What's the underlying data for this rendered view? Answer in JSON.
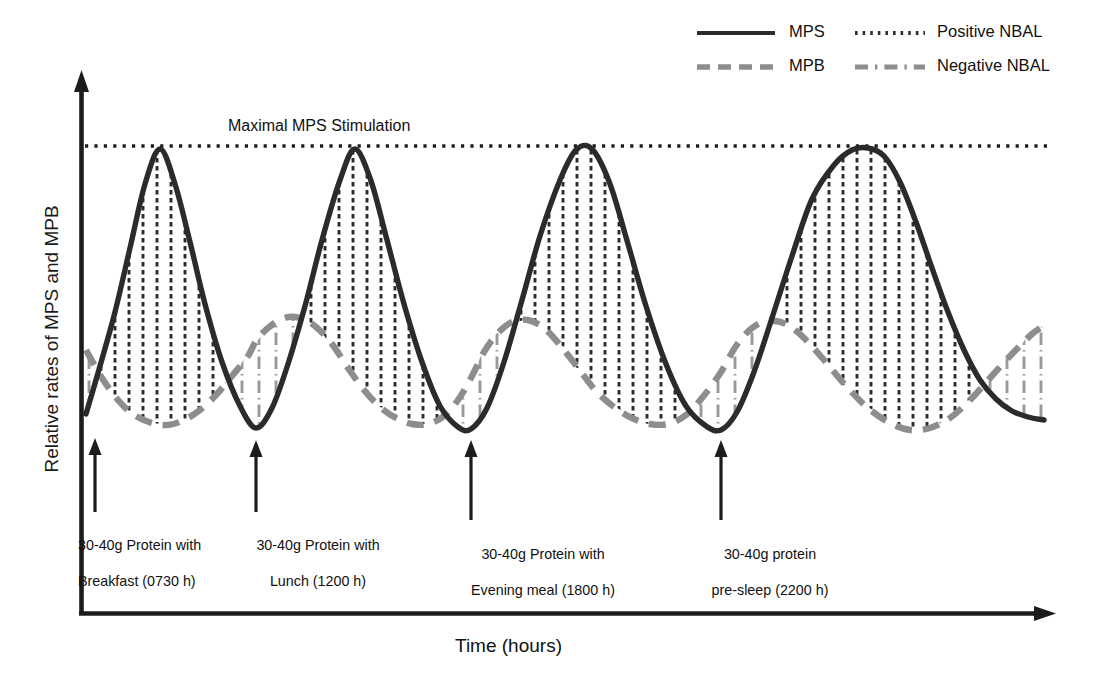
{
  "figure": {
    "xlabel": "Time (hours)",
    "ylabel": "Relative rates of MPS and MPB",
    "maximal_line_label": "Maximal MPS Stimulation"
  },
  "legend": {
    "items": [
      {
        "label": "MPS",
        "style": "solid",
        "color": "#2b2b2b"
      },
      {
        "label": "Positive NBAL",
        "style": "dotted",
        "color": "#2b2b2b"
      },
      {
        "label": "MPB",
        "style": "dashed",
        "color": "#8d8d8d"
      },
      {
        "label": "Negative NBAL",
        "style": "dash-dot",
        "color": "#8d8d8d"
      }
    ]
  },
  "annotations": [
    {
      "id": "breakfast",
      "line1": "30-40g Protein with",
      "line2": "Breakfast (0730 h)",
      "arrow_x": 95,
      "arrow_top": 438,
      "arrow_bottom": 512
    },
    {
      "id": "lunch",
      "line1": "30-40g Protein with",
      "line2": "Lunch (1200 h)",
      "arrow_x": 256,
      "arrow_top": 440,
      "arrow_bottom": 512
    },
    {
      "id": "evening-meal",
      "line1": "30-40g Protein with",
      "line2": "Evening meal (1800 h)",
      "arrow_x": 471,
      "arrow_top": 440,
      "arrow_bottom": 520
    },
    {
      "id": "pre-sleep",
      "line1": "30-40g protein",
      "line2": "pre-sleep (2200 h)",
      "arrow_x": 721,
      "arrow_top": 440,
      "arrow_bottom": 520
    }
  ],
  "colors": {
    "mps": "#2b2b2b",
    "mpb": "#8d8d8d",
    "axis": "#1c1c1c",
    "positive_nbal_hatch": "#2b2b2b",
    "negative_nbal_hatch": "#9a9a9a",
    "background": "#ffffff"
  },
  "chart_data": {
    "type": "line",
    "title": "",
    "xlabel": "Time (hours)",
    "ylabel": "Relative rates of MPS and MPB",
    "legend_position": "top-right",
    "grid": false,
    "axis_px": {
      "x_axis_y": 614,
      "y_axis_x": 81,
      "x_end": 1055,
      "y_top": 74
    },
    "maximal_mps_line_y_px": 146,
    "series": [
      {
        "name": "MPS",
        "style": "solid",
        "color": "#2b2b2b",
        "points_px": [
          [
            86,
            414
          ],
          [
            100,
            366
          ],
          [
            115,
            312
          ],
          [
            130,
            248
          ],
          [
            145,
            184
          ],
          [
            160,
            149
          ],
          [
            175,
            184
          ],
          [
            190,
            242
          ],
          [
            205,
            304
          ],
          [
            222,
            362
          ],
          [
            240,
            406
          ],
          [
            256,
            428
          ],
          [
            272,
            408
          ],
          [
            288,
            364
          ],
          [
            305,
            306
          ],
          [
            322,
            240
          ],
          [
            340,
            180
          ],
          [
            355,
            149
          ],
          [
            371,
            181
          ],
          [
            387,
            240
          ],
          [
            404,
            304
          ],
          [
            422,
            362
          ],
          [
            440,
            406
          ],
          [
            458,
            427
          ],
          [
            471,
            429
          ],
          [
            487,
            408
          ],
          [
            504,
            362
          ],
          [
            522,
            300
          ],
          [
            540,
            236
          ],
          [
            560,
            180
          ],
          [
            576,
            150
          ],
          [
            592,
            149
          ],
          [
            610,
            184
          ],
          [
            628,
            244
          ],
          [
            646,
            306
          ],
          [
            666,
            364
          ],
          [
            686,
            406
          ],
          [
            706,
            426
          ],
          [
            721,
            430
          ],
          [
            737,
            412
          ],
          [
            754,
            372
          ],
          [
            772,
            318
          ],
          [
            792,
            256
          ],
          [
            812,
            199
          ],
          [
            834,
            165
          ],
          [
            852,
            150
          ],
          [
            868,
            148
          ],
          [
            884,
            156
          ],
          [
            900,
            182
          ],
          [
            916,
            222
          ],
          [
            932,
            268
          ],
          [
            948,
            312
          ],
          [
            964,
            350
          ],
          [
            980,
            380
          ],
          [
            996,
            399
          ],
          [
            1012,
            411
          ],
          [
            1028,
            417
          ],
          [
            1044,
            420
          ]
        ]
      },
      {
        "name": "MPB",
        "style": "dashed",
        "color": "#8d8d8d",
        "points_px": [
          [
            86,
            350
          ],
          [
            102,
            378
          ],
          [
            118,
            400
          ],
          [
            134,
            415
          ],
          [
            152,
            423
          ],
          [
            168,
            425
          ],
          [
            184,
            420
          ],
          [
            200,
            410
          ],
          [
            216,
            395
          ],
          [
            232,
            376
          ],
          [
            248,
            356
          ],
          [
            256,
            341
          ],
          [
            268,
            328
          ],
          [
            284,
            318
          ],
          [
            300,
            318
          ],
          [
            316,
            327
          ],
          [
            332,
            344
          ],
          [
            348,
            368
          ],
          [
            364,
            390
          ],
          [
            380,
            407
          ],
          [
            396,
            418
          ],
          [
            412,
            424
          ],
          [
            428,
            424
          ],
          [
            444,
            416
          ],
          [
            458,
            400
          ],
          [
            471,
            378
          ],
          [
            484,
            352
          ],
          [
            498,
            333
          ],
          [
            512,
            322
          ],
          [
            528,
            320
          ],
          [
            544,
            328
          ],
          [
            560,
            345
          ],
          [
            578,
            368
          ],
          [
            596,
            391
          ],
          [
            614,
            407
          ],
          [
            632,
            418
          ],
          [
            650,
            424
          ],
          [
            668,
            424
          ],
          [
            686,
            415
          ],
          [
            702,
            398
          ],
          [
            721,
            372
          ],
          [
            736,
            346
          ],
          [
            752,
            328
          ],
          [
            768,
            321
          ],
          [
            786,
            324
          ],
          [
            804,
            338
          ],
          [
            824,
            360
          ],
          [
            846,
            386
          ],
          [
            868,
            408
          ],
          [
            890,
            423
          ],
          [
            910,
            430
          ],
          [
            930,
            428
          ],
          [
            950,
            418
          ],
          [
            970,
            400
          ],
          [
            990,
            378
          ],
          [
            1012,
            354
          ],
          [
            1032,
            334
          ],
          [
            1044,
            326
          ]
        ]
      }
    ],
    "feedings": [
      {
        "label": "30-40g Protein with Breakfast (0730 h)",
        "time": "0730 h",
        "dose": "30-40g"
      },
      {
        "label": "30-40g Protein with Lunch (1200 h)",
        "time": "1200 h",
        "dose": "30-40g"
      },
      {
        "label": "30-40g Protein with Evening meal (1800 h)",
        "time": "1800 h",
        "dose": "30-40g"
      },
      {
        "label": "30-40g protein pre-sleep (2200 h)",
        "time": "2200 h",
        "dose": "30-40g"
      }
    ]
  }
}
